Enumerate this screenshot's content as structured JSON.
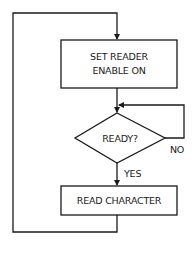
{
  "flowchart": {
    "nodes": [
      {
        "id": "set-reader",
        "type": "process",
        "line1": "SET READER",
        "line2": "ENABLE ON"
      },
      {
        "id": "ready",
        "type": "decision",
        "label": "READY?"
      },
      {
        "id": "read-char",
        "type": "process",
        "label": "READ CHARACTER"
      }
    ],
    "edges": {
      "no_label": "NO",
      "yes_label": "YES"
    },
    "colors": {
      "stroke": "#1a1a1a",
      "background": "#ffffff"
    }
  }
}
